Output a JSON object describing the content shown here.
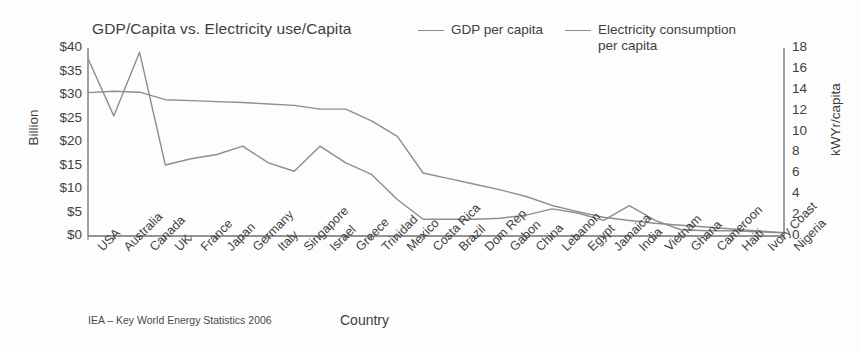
{
  "chart_data": {
    "type": "line",
    "title": "GDP/Capita vs. Electricity use/Capita",
    "xlabel": "Country",
    "ylabel": "Billion",
    "y2label": "kWYr/capita",
    "source": "IEA – Key World Energy Statistics 2006",
    "grid": false,
    "legend_position": "top-right",
    "ylim": [
      0,
      40
    ],
    "y2lim": [
      0,
      18
    ],
    "yticks": [
      "$0",
      "$5",
      "$10",
      "$15",
      "$20",
      "$25",
      "$30",
      "$35",
      "$40"
    ],
    "ytick_values": [
      0,
      5,
      10,
      15,
      20,
      25,
      30,
      35,
      40
    ],
    "y2ticks": [
      "0",
      "2",
      "4",
      "6",
      "8",
      "10",
      "12",
      "14",
      "16",
      "18"
    ],
    "y2tick_values": [
      0,
      2,
      4,
      6,
      8,
      10,
      12,
      14,
      16,
      18
    ],
    "categories": [
      "USA",
      "Australia",
      "Canada",
      "UK",
      "France",
      "Japan",
      "Germany",
      "Italy",
      "Singapore",
      "Israel",
      "Greece",
      "Trinidad",
      "Mexico",
      "Costa Rica",
      "Brazil",
      "Dom Rep",
      "Gabon",
      "China",
      "Lebanon",
      "Egypt",
      "Jamaica",
      "India",
      "Vietnam",
      "Ghana",
      "Cameroon",
      "Haiti",
      "Ivory Coast",
      "Nigeria"
    ],
    "series": [
      {
        "name": "GDP per capita",
        "axis": "left",
        "unit": "Billion",
        "color": "#8d8d8d",
        "values": [
          30.5,
          30.8,
          30.6,
          29.0,
          28.8,
          28.6,
          28.4,
          28.1,
          27.8,
          27.0,
          27.0,
          24.5,
          21.2,
          13.4,
          12.2,
          11.0,
          9.8,
          8.4,
          6.5,
          5.2,
          4.0,
          3.3,
          2.7,
          2.3,
          1.9,
          1.5,
          1.1,
          0.7
        ]
      },
      {
        "name": "Electricity consumption\nper capita",
        "axis": "right",
        "unit": "kWYr/capita",
        "color": "#8d8d8d",
        "values": [
          17.0,
          11.5,
          17.6,
          6.8,
          7.4,
          7.8,
          8.6,
          7.0,
          6.2,
          8.6,
          7.0,
          5.9,
          3.5,
          1.6,
          1.6,
          1.6,
          1.7,
          2.0,
          2.6,
          2.2,
          1.5,
          2.9,
          1.5,
          0.6,
          0.5,
          0.5,
          0.4,
          0.3
        ]
      }
    ]
  }
}
